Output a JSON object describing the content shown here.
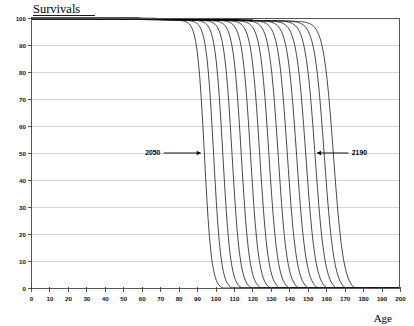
{
  "chart_data": {
    "type": "line",
    "title": "Survivals",
    "xlabel": "Age",
    "ylabel": "Survivals",
    "xlim": [
      0,
      200
    ],
    "ylim": [
      0,
      100
    ],
    "grid": true,
    "legend": "none",
    "x_ticks": [
      0,
      10,
      20,
      30,
      40,
      50,
      60,
      70,
      80,
      90,
      100,
      110,
      120,
      130,
      140,
      150,
      160,
      170,
      180,
      190,
      200
    ],
    "y_ticks": [
      0,
      10,
      20,
      30,
      40,
      50,
      60,
      70,
      80,
      90,
      100
    ],
    "x_tick_labels": [
      "0",
      "10",
      "20",
      "30",
      "40",
      "50",
      "60",
      "70",
      "80",
      "90",
      "100",
      "110",
      "120",
      "130",
      "140",
      "150",
      "160",
      "170",
      "180",
      "190",
      "200"
    ],
    "y_tick_labels": [
      "0",
      "10",
      "20",
      "30",
      "40",
      "50",
      "60",
      "70",
      "80",
      "90",
      "100"
    ],
    "annotations": [
      {
        "text": "2050",
        "x": 66,
        "y": 50,
        "arrow_to_x": 92,
        "arrow_dir": "right"
      },
      {
        "text": "2190",
        "x": 178,
        "y": 50,
        "arrow_to_x": 155,
        "arrow_dir": "left"
      }
    ],
    "series_note": "Survival curves by projection year, 2050 to 2190 in 10-year steps",
    "series": [
      {
        "name": "2050",
        "midpoint_age": 94,
        "steepness": 0.52,
        "plateau": 99.5
      },
      {
        "name": "2060",
        "midpoint_age": 99,
        "steepness": 0.5,
        "plateau": 99.5
      },
      {
        "name": "2070",
        "midpoint_age": 104,
        "steepness": 0.48,
        "plateau": 99.6
      },
      {
        "name": "2080",
        "midpoint_age": 109,
        "steepness": 0.46,
        "plateau": 99.6
      },
      {
        "name": "2090",
        "midpoint_age": 114,
        "steepness": 0.45,
        "plateau": 99.6
      },
      {
        "name": "2100",
        "midpoint_age": 119,
        "steepness": 0.44,
        "plateau": 99.7
      },
      {
        "name": "2110",
        "midpoint_age": 124,
        "steepness": 0.43,
        "plateau": 99.7
      },
      {
        "name": "2120",
        "midpoint_age": 129,
        "steepness": 0.42,
        "plateau": 99.7
      },
      {
        "name": "2130",
        "midpoint_age": 134,
        "steepness": 0.41,
        "plateau": 99.8
      },
      {
        "name": "2140",
        "midpoint_age": 139,
        "steepness": 0.4,
        "plateau": 99.8
      },
      {
        "name": "2150",
        "midpoint_age": 144,
        "steepness": 0.39,
        "plateau": 99.8
      },
      {
        "name": "2160",
        "midpoint_age": 149,
        "steepness": 0.385,
        "plateau": 99.8
      },
      {
        "name": "2170",
        "midpoint_age": 154,
        "steepness": 0.38,
        "plateau": 99.9
      },
      {
        "name": "2180",
        "midpoint_age": 159,
        "steepness": 0.375,
        "plateau": 99.9
      },
      {
        "name": "2190",
        "midpoint_age": 164,
        "steepness": 0.37,
        "plateau": 99.9
      }
    ]
  },
  "colors": {
    "curve": "#1a1a1a",
    "grid": "#c9c9c9",
    "axis": "#555555",
    "background": "#ffffff"
  }
}
